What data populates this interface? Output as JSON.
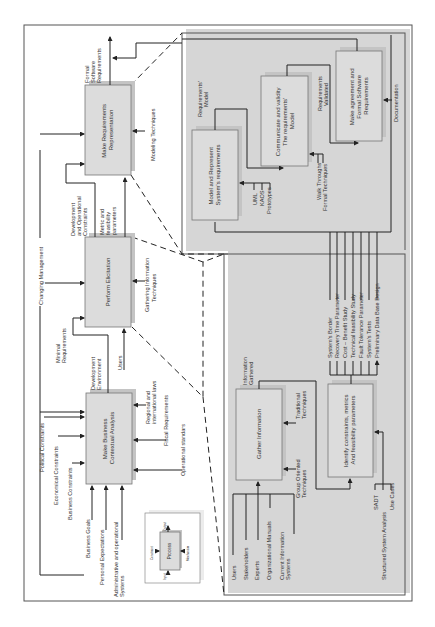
{
  "diagram": {
    "type": "IDEF0 process model (rotated 90° counter-clockwise)",
    "main_processes": [
      {
        "id": "business",
        "label_lines": [
          "Make Business",
          "Contextual Analysis"
        ]
      },
      {
        "id": "elicitation",
        "label_lines": [
          "Perform Elicitation"
        ]
      },
      {
        "id": "representation",
        "label_lines": [
          "Make Requirements",
          "Representation"
        ]
      }
    ],
    "business_inputs": [
      "Business Goals",
      "Personal Expectations",
      "Administrative and operational",
      "Systems"
    ],
    "business_constraints": [
      "Political Constraints",
      "Economical Constraints",
      "Business Constraints"
    ],
    "business_mechanisms": [
      "Regional and",
      "international laws",
      "Fiscal Requirements",
      "Operational standars"
    ],
    "business_outputs": [
      "Development",
      "Environment"
    ],
    "flow_labels": {
      "changing_management": "Changing Management",
      "minimal_requirements": [
        "Minimal",
        "Requirements"
      ],
      "users": "Users",
      "gathering_techniques": [
        "Gathering Information",
        "Techniques"
      ],
      "dev_op_constraints": [
        "Development",
        "and Operational",
        "Constraints"
      ],
      "metric_params": [
        "Metric and",
        "feasibility",
        "parameters"
      ],
      "modeling_techniques": "Modeling Techniques",
      "formal_software_requirements": [
        "Formal",
        "Software",
        "Requirements"
      ]
    },
    "representation_detail": {
      "boxes": [
        {
          "id": "model",
          "label_lines": [
            "Model and Represent",
            "System's requirements"
          ]
        },
        {
          "id": "communicate",
          "label_lines": [
            "Communicate and validity",
            "The requirements'",
            "Model"
          ]
        },
        {
          "id": "agreement",
          "label_lines": [
            "Make agreement and",
            "Formal Software",
            "Requirements"
          ]
        }
      ],
      "labels": {
        "requirements_model": [
          "Requirements'",
          "Model"
        ],
        "requirements_validated": [
          "Requirements",
          "Validated"
        ],
        "model_mechanisms": [
          "UML",
          "KAOS",
          "Prototypes"
        ],
        "communicate_mechanisms": [
          "Walk Throughs",
          "Formal Techniques"
        ],
        "documentation": "Documentation"
      }
    },
    "elicitation_detail": {
      "boxes": [
        {
          "id": "gather",
          "label_lines": [
            "Gather Information"
          ]
        },
        {
          "id": "identify",
          "label_lines": [
            "Identify constraints, metrics",
            "And feasibility parameters"
          ]
        }
      ],
      "labels": {
        "information_gathered": [
          "Information",
          "Gathered"
        ],
        "traditional_techniques": [
          "Traditional",
          "Techniques"
        ],
        "group_techniques": [
          "Group Oriented",
          "Techniques"
        ],
        "sources": [
          "Users",
          "Stakeholders",
          "Experts",
          "Organizational Manuals",
          "Current Information",
          "Systems"
        ],
        "identify_mechanisms": [
          "SADT",
          "Structured System Analysis",
          "Use Cases"
        ],
        "identify_outputs": [
          "System's Border",
          "Recovery Time Parameter",
          "Cost – Benefit Study",
          "Technical feasibility Study",
          "Fault Tolerance Parameter",
          "System's Tests",
          "Preliminary Data Base Design"
        ]
      }
    },
    "legend": {
      "process": "Process",
      "input": "Input",
      "output": "Output",
      "constraint": "Constraint",
      "mechanism": "Mechanism"
    }
  }
}
